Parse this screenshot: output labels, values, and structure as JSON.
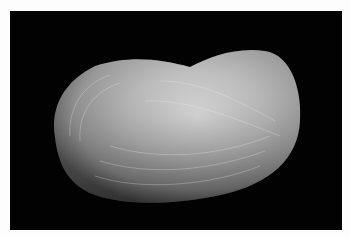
{
  "image": {
    "subject": "bivalve shell, lateral view",
    "background_color": "#020202",
    "page_color": "#fdfdfd",
    "shell_color_light": "#d8d8d8",
    "shell_color_dark": "#6a6a6a"
  }
}
